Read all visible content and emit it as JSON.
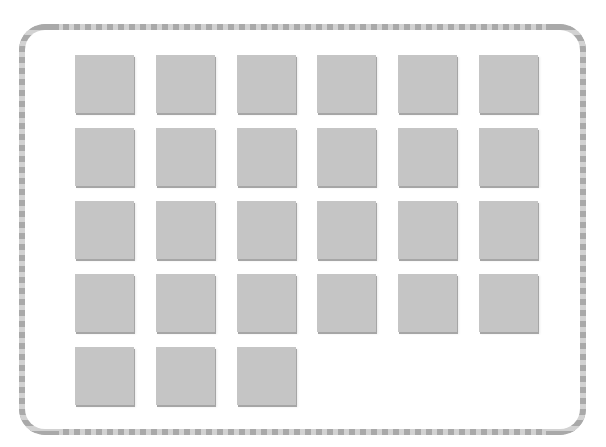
{
  "canvas": {
    "width": 606,
    "height": 447,
    "background": "#ffffff"
  },
  "frame": {
    "style": "rounded dashed border",
    "stripe_dark": "#a9a9a9",
    "stripe_light": "#d2d2d2"
  },
  "grid": {
    "columns": 6,
    "rows": 5,
    "tile_color": "#c5c5c5",
    "tile_shadow": "#a6a6a6",
    "tile_count": 27,
    "tiles": [
      {
        "row": 1,
        "col": 1
      },
      {
        "row": 1,
        "col": 2
      },
      {
        "row": 1,
        "col": 3
      },
      {
        "row": 1,
        "col": 4
      },
      {
        "row": 1,
        "col": 5
      },
      {
        "row": 1,
        "col": 6
      },
      {
        "row": 2,
        "col": 1
      },
      {
        "row": 2,
        "col": 2
      },
      {
        "row": 2,
        "col": 3
      },
      {
        "row": 2,
        "col": 4
      },
      {
        "row": 2,
        "col": 5
      },
      {
        "row": 2,
        "col": 6
      },
      {
        "row": 3,
        "col": 1
      },
      {
        "row": 3,
        "col": 2
      },
      {
        "row": 3,
        "col": 3
      },
      {
        "row": 3,
        "col": 4
      },
      {
        "row": 3,
        "col": 5
      },
      {
        "row": 3,
        "col": 6
      },
      {
        "row": 4,
        "col": 1
      },
      {
        "row": 4,
        "col": 2
      },
      {
        "row": 4,
        "col": 3
      },
      {
        "row": 4,
        "col": 4
      },
      {
        "row": 4,
        "col": 5
      },
      {
        "row": 4,
        "col": 6
      },
      {
        "row": 5,
        "col": 1
      },
      {
        "row": 5,
        "col": 2
      },
      {
        "row": 5,
        "col": 3
      }
    ]
  }
}
